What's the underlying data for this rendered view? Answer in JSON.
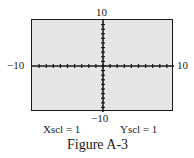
{
  "figure": {
    "caption": "Figure A-3",
    "window": {
      "ymax_label": "10",
      "ymin_label": "−10",
      "xmin_label": "−10",
      "xmax_label": "10",
      "xscl_label": "Xscl = 1",
      "yscl_label": "Yscl = 1",
      "xmin": -10,
      "xmax": 10,
      "ymin": -10,
      "ymax": 10,
      "xscl": 1,
      "yscl": 1,
      "background_color": "#e6e6e6",
      "axis_color": "#1a1a1a"
    }
  }
}
